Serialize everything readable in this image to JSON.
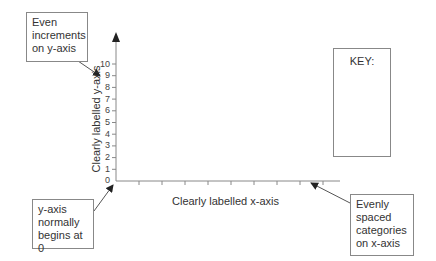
{
  "diagram": {
    "y_axis": {
      "label": "Clearly labelled y-axis",
      "ticks": [
        "0",
        "1",
        "2",
        "3",
        "4",
        "5",
        "6",
        "7",
        "8",
        "9",
        "10"
      ]
    },
    "x_axis": {
      "label": "Clearly labelled x-axis",
      "category_tick_count": 9
    },
    "key": {
      "title": "KEY:"
    },
    "callouts": [
      {
        "id": "even-increments",
        "text": "Even increments on y-axis"
      },
      {
        "id": "starts-at-zero",
        "text": "y-axis normally begins at 0"
      },
      {
        "id": "evenly-spaced",
        "text": "Evenly spaced categories on x-axis"
      }
    ],
    "colors": {
      "axis": "#888888",
      "text": "#333333",
      "border": "#888888",
      "arrow": "#222222"
    }
  }
}
